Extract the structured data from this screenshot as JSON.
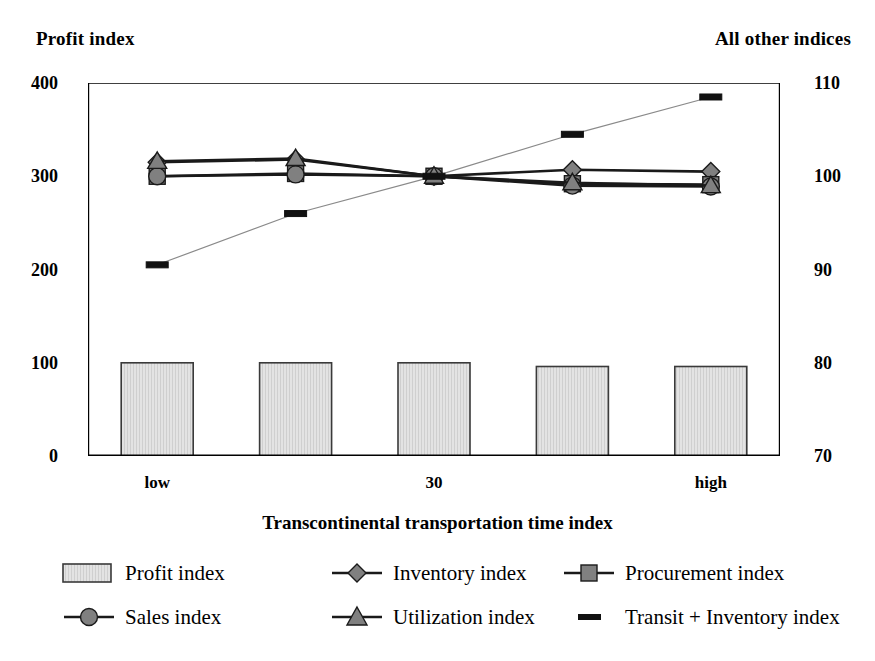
{
  "header": {
    "left_axis_title": "Profit index",
    "right_axis_title": "All other indices"
  },
  "axes": {
    "x_title": "Transcontinental transportation time index",
    "y_left_ticks": [
      "400",
      "300",
      "200",
      "100",
      "0"
    ],
    "y_right_ticks": [
      "110",
      "100",
      "90",
      "80",
      "70"
    ],
    "x_tick_labels": [
      "low",
      "",
      "30",
      "",
      "high"
    ]
  },
  "legend": {
    "rows": [
      [
        {
          "label": "Profit index",
          "marker": "bar-swatch-icon"
        },
        {
          "label": "Inventory index",
          "marker": "diamond-marker-icon"
        },
        {
          "label": "Procurement index",
          "marker": "square-marker-icon"
        }
      ],
      [
        {
          "label": "Sales index",
          "marker": "circle-marker-icon"
        },
        {
          "label": "Utilization index",
          "marker": "triangle-marker-icon"
        },
        {
          "label": "Transit + Inventory index",
          "marker": "dash-marker-icon"
        }
      ]
    ]
  },
  "colors": {
    "marker_fill": "#808080",
    "bar_fill": "#e3e3e3",
    "bar_stroke": "#3a3a3a",
    "line_stroke": "#1a1a1a",
    "thin_line_stroke": "#8a8a8a",
    "axis": "#000000"
  },
  "chart_data": {
    "type": "bar",
    "title": "",
    "xlabel": "Transcontinental transportation time index",
    "ylabel": "Profit index",
    "y2label": "All other indices",
    "categories": [
      "low",
      "",
      "30",
      "",
      "high"
    ],
    "ylim": [
      0,
      400
    ],
    "y2lim": [
      70,
      110
    ],
    "grid": false,
    "legend_position": "bottom",
    "series": [
      {
        "name": "Profit index",
        "axis": "left",
        "type": "bar",
        "values": [
          100,
          100,
          100,
          96,
          96
        ]
      },
      {
        "name": "Inventory index",
        "axis": "right",
        "type": "line",
        "marker": "diamond",
        "values": [
          101.5,
          101.8,
          100.0,
          100.7,
          100.5
        ]
      },
      {
        "name": "Procurement index",
        "axis": "right",
        "type": "line",
        "marker": "square",
        "values": [
          100.0,
          100.3,
          100.0,
          99.2,
          99.1
        ]
      },
      {
        "name": "Sales index",
        "axis": "right",
        "type": "line",
        "marker": "circle",
        "values": [
          100.0,
          100.2,
          100.0,
          99.0,
          98.9
        ]
      },
      {
        "name": "Utilization index",
        "axis": "right",
        "type": "line",
        "marker": "triangle",
        "values": [
          101.6,
          101.9,
          100.0,
          99.3,
          99.0
        ]
      },
      {
        "name": "Transit + Inventory index",
        "axis": "right",
        "type": "line",
        "marker": "dash",
        "values": [
          90.5,
          96.0,
          100.0,
          104.5,
          108.5
        ]
      }
    ]
  }
}
